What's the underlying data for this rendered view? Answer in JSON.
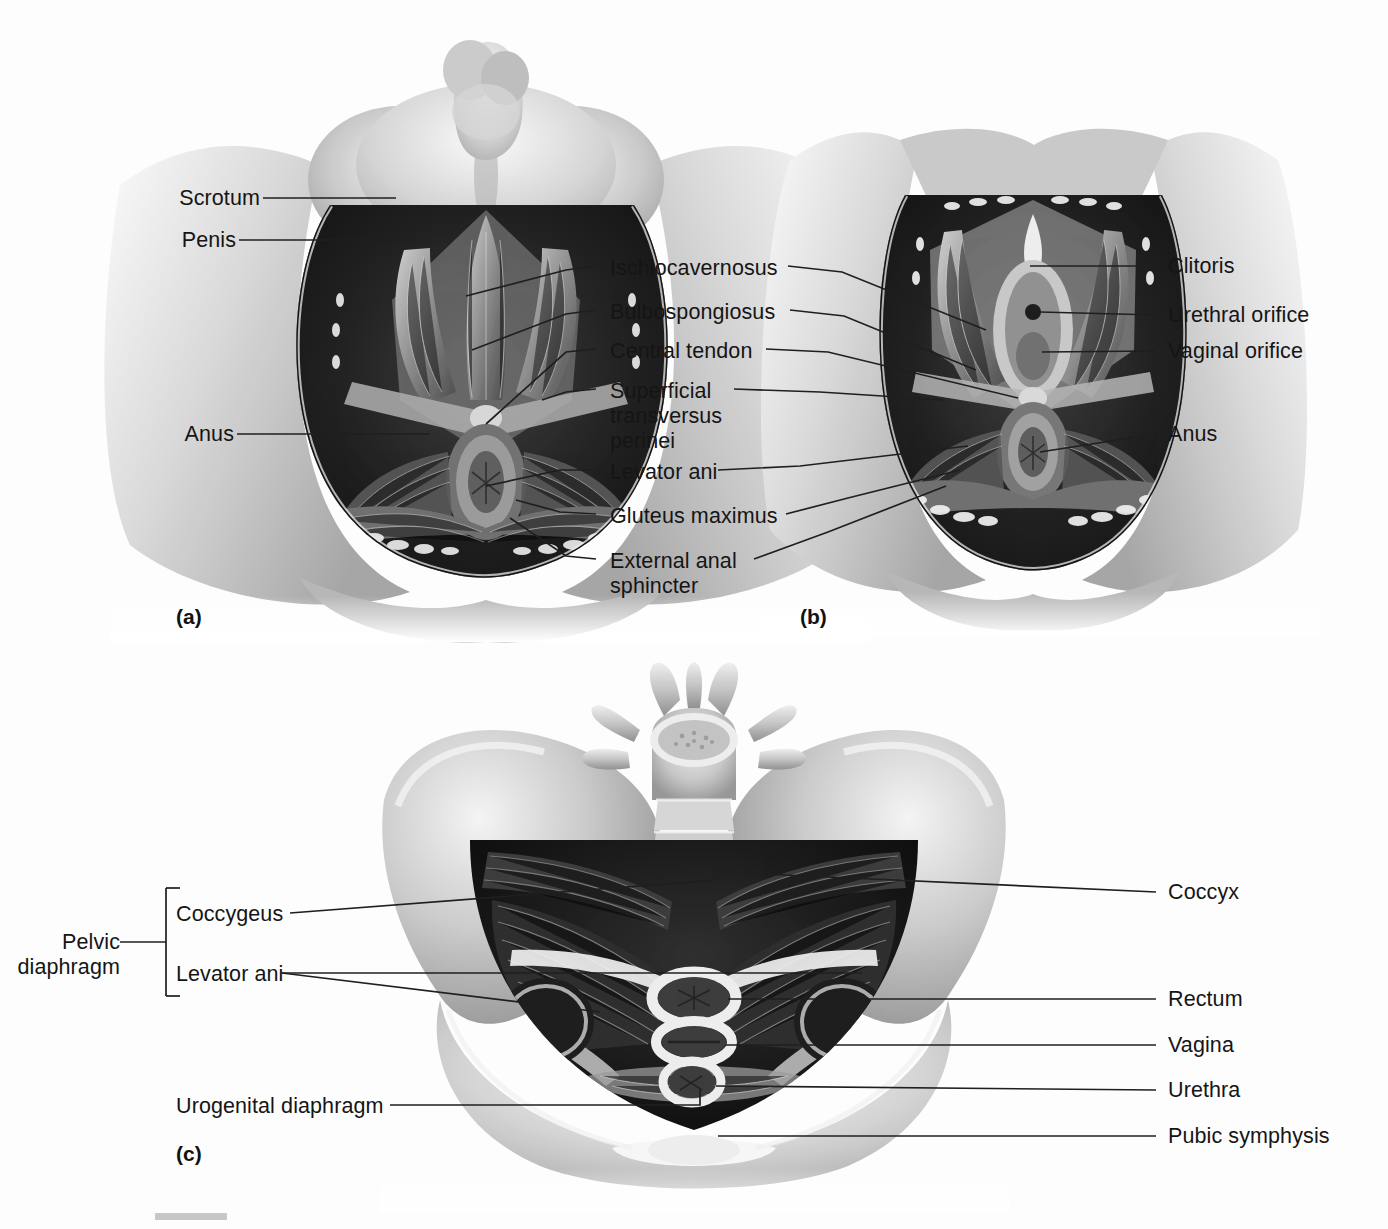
{
  "figure": {
    "type": "anatomical-illustration",
    "panels": [
      {
        "id": "panel-a",
        "marker": "(a)",
        "caption": "Male perineum, superficial dissection"
      },
      {
        "id": "panel-b",
        "marker": "(b)",
        "caption": "Female perineum, superficial dissection"
      },
      {
        "id": "panel-c",
        "marker": "(c)",
        "caption": "Female pelvic diaphragm, superior view"
      }
    ]
  },
  "panel_a": {
    "marker": "(a)",
    "left_labels": [
      {
        "text": "Scrotum",
        "x": 176,
        "y": 186,
        "line_from_x": 263,
        "line_from_y": 198,
        "line_to_x": 396,
        "line_to_y": 198
      },
      {
        "text": "Penis",
        "x": 176,
        "y": 228,
        "line_from_x": 239,
        "line_from_y": 240,
        "line_to_x": 414,
        "line_to_y": 240
      },
      {
        "text": "Anus",
        "x": 176,
        "y": 422,
        "line_from_x": 237,
        "line_from_y": 434,
        "line_to_x": 425,
        "line_to_y": 434
      }
    ]
  },
  "center_labels": [
    {
      "text": "Ischiocavernosus",
      "lines": [
        "Ischiocavernosus"
      ],
      "x": 610,
      "y": 256
    },
    {
      "text": "Bulbospongiosus",
      "lines": [
        "Bulbospongiosus"
      ],
      "x": 610,
      "y": 300
    },
    {
      "text": "Central tendon",
      "lines": [
        "Central tendon"
      ],
      "x": 610,
      "y": 339
    },
    {
      "text": "Superficial transversus perinei",
      "lines": [
        "Superficial",
        "transversus",
        "perinei"
      ],
      "x": 610,
      "y": 379
    },
    {
      "text": "Levator ani",
      "lines": [
        "Levator ani"
      ],
      "x": 610,
      "y": 460
    },
    {
      "text": "Gluteus maximus",
      "lines": [
        "Gluteus maximus"
      ],
      "x": 610,
      "y": 504
    },
    {
      "text": "External anal sphincter",
      "lines": [
        "External anal",
        "sphincter"
      ],
      "x": 610,
      "y": 549
    }
  ],
  "panel_b": {
    "marker": "(b)",
    "right_labels": [
      {
        "text": "Clitoris",
        "x": 1168,
        "y": 254
      },
      {
        "text": "Urethral orifice",
        "x": 1168,
        "y": 303
      },
      {
        "text": "Vaginal orifice",
        "x": 1168,
        "y": 339
      },
      {
        "text": "Anus",
        "x": 1168,
        "y": 422
      }
    ]
  },
  "panel_c": {
    "marker": "(c)",
    "bracket_label": {
      "lines": [
        "Pelvic",
        "diaphragm"
      ],
      "x": 50,
      "y": 930
    },
    "bracket_items": [
      {
        "text": "Coccygeus",
        "x": 176,
        "y": 902
      },
      {
        "text": "Levator ani",
        "x": 176,
        "y": 962
      }
    ],
    "left_labels": [
      {
        "text": "Urogenital diaphragm",
        "x": 176,
        "y": 1094
      }
    ],
    "right_labels": [
      {
        "text": "Coccyx",
        "x": 1168,
        "y": 880
      },
      {
        "text": "Rectum",
        "x": 1168,
        "y": 987
      },
      {
        "text": "Vagina",
        "x": 1168,
        "y": 1033
      },
      {
        "text": "Urethra",
        "x": 1168,
        "y": 1078
      },
      {
        "text": "Pubic symphysis",
        "x": 1168,
        "y": 1124
      }
    ]
  },
  "colors": {
    "background": "#fdfdfd",
    "label_text": "#151515",
    "leader_line": "#1b1b1b",
    "art_dark": "#171717",
    "art_mid": "#8b8b8b",
    "art_light": "#e3e3e3"
  }
}
